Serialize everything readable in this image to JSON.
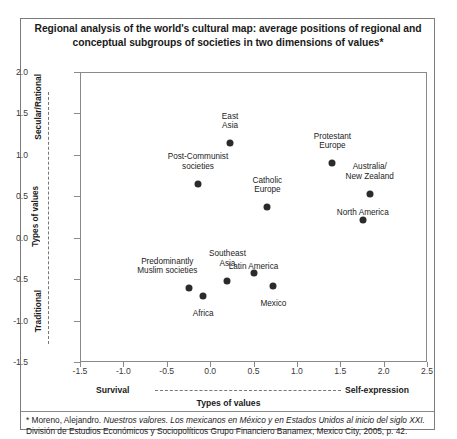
{
  "title": "Regional analysis of the world's cultural map: average positions of regional and conceptual subgroups of societies in two dimensions of values*",
  "axes": {
    "y_top_label": "Secular/Rational",
    "y_bottom_label": "Traditional",
    "y_axis_title": "Types of values",
    "x_left_label": "Survival",
    "x_right_label": "Self-expression",
    "x_axis_title": "Types of values"
  },
  "footnote": {
    "part1": "* Moreno, Alejandro.  ",
    "italic1": "Nuestros  valores. Los mexicanos en México y en Estados Unidos al inicio del siglo XXI.",
    "part2": " División de Estudios Económicos y Sociopolíticos Grupo Financiero Banamex, Mexico City, 2005, p. 42."
  },
  "chart_data": {
    "type": "scatter",
    "title": "Regional analysis of the world's cultural map: average positions of regional and conceptual subgroups of societies in two dimensions of values",
    "xlabel": "Types of values",
    "ylabel": "Types of values",
    "xlim": [
      -1.5,
      2.5
    ],
    "ylim": [
      -1.5,
      2.0
    ],
    "xticks": [
      "-1.5",
      "-1.0",
      "-0.5",
      "0.0",
      "0.5",
      "1.0",
      "1.5",
      "2.0",
      "2.5"
    ],
    "xtick_values": [
      -1.5,
      -1.0,
      -0.5,
      0.0,
      0.5,
      1.0,
      1.5,
      2.0,
      2.5
    ],
    "yticks": [
      "2.0",
      "1.5",
      "1.0",
      "0.5",
      "0.0",
      "-0.5",
      "-1.0",
      "-1.5"
    ],
    "ytick_values": [
      2.0,
      1.5,
      1.0,
      0.5,
      0.0,
      -0.5,
      -1.0,
      -1.5
    ],
    "grid": false,
    "legend": "none",
    "marker_color": "#2b2b2b",
    "points": [
      {
        "label": "East\nAsia",
        "x": 0.23,
        "y": 1.14,
        "label_dx": 0,
        "label_dy": -22
      },
      {
        "label": "Post-Communist\nsocieties",
        "x": -0.14,
        "y": 0.65,
        "label_dx": 0,
        "label_dy": -22
      },
      {
        "label": "Protestant\nEurope",
        "x": 1.41,
        "y": 0.9,
        "label_dx": 0,
        "label_dy": -22
      },
      {
        "label": "Catholic\nEurope",
        "x": 0.66,
        "y": 0.37,
        "label_dx": 0,
        "label_dy": -22
      },
      {
        "label": "Australia/\nNew Zealand",
        "x": 1.84,
        "y": 0.53,
        "label_dx": 0,
        "label_dy": -22
      },
      {
        "label": "North America",
        "x": 1.76,
        "y": 0.21,
        "label_dx": 0,
        "label_dy": -12
      },
      {
        "label": "Predominantly\nMuslim societies",
        "x": -0.24,
        "y": -0.61,
        "label_dx": -22,
        "label_dy": -22
      },
      {
        "label": "Africa",
        "x": -0.08,
        "y": -0.7,
        "label_dx": 0,
        "label_dy": 13
      },
      {
        "label": "Southeast\nAsia",
        "x": 0.2,
        "y": -0.52,
        "label_dx": 0,
        "label_dy": -22
      },
      {
        "label": "Latin America",
        "x": 0.5,
        "y": -0.42,
        "label_dx": 0,
        "label_dy": -11
      },
      {
        "label": "Mexico",
        "x": 0.73,
        "y": -0.58,
        "label_dx": 0,
        "label_dy": 13
      }
    ]
  }
}
